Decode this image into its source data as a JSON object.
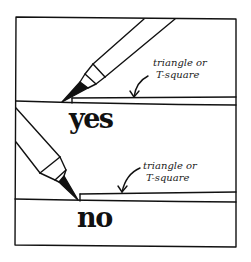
{
  "illustration": {
    "subject": "technical pen against ruling edge",
    "panels": [
      {
        "id": "correct",
        "verdict": "yes",
        "annotation_line1": "triangle or",
        "annotation_line2": "T-square"
      },
      {
        "id": "incorrect",
        "verdict": "no",
        "annotation_line1": "triangle or",
        "annotation_line2": "T-square"
      }
    ],
    "colors": {
      "ink": "#111111",
      "paper": "#ffffff"
    }
  }
}
